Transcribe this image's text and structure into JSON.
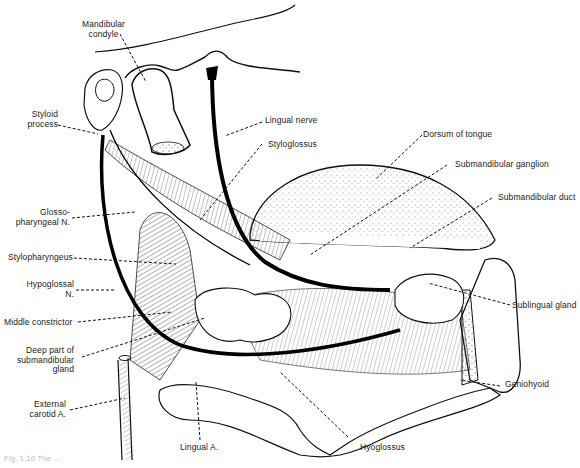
{
  "diagram": {
    "style": "black-and-white anatomical line drawing",
    "labels": {
      "mandibular_condyle": "Mandibular\ncondyle",
      "styloid_process": "Styloid\nprocess",
      "lingual_nerve": "Lingual nerve",
      "styloglossus": "Styloglossus",
      "dorsum_of_tongue": "Dorsum of tongue",
      "submandibular_ganglion": "Submandibular ganglion",
      "submandibular_duct": "Submandibular duct",
      "glossopharyngeal_n": "Glosso-\npharyngeal N.",
      "stylopharyngeus": "Stylopharyngeus",
      "hypoglossal_n": "Hypoglossal\nN.",
      "middle_constrictor": "Middle constrictor",
      "deep_part_submandibular_gland": "Deep part of\nsubmandibular\ngland",
      "sublingual_gland": "Sublingual gland",
      "geniohyoid": "Geniohyoid",
      "external_carotid_a": "External\ncarotid A.",
      "lingual_a": "Lingual A.",
      "hyoglossus": "Hyoglossus"
    },
    "caption_fragment": "Fig. 1.10 The ..."
  }
}
